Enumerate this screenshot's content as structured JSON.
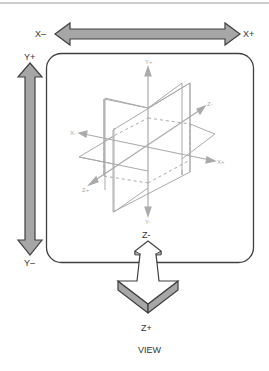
{
  "diagram": {
    "title": "VIEW",
    "labels": {
      "x_minus": "X–",
      "x_plus": "X+",
      "y_plus": "Y+",
      "y_minus": "Y–",
      "z_minus": "Z-",
      "z_plus": "Z+"
    },
    "inner_axes": {
      "y_plus": "Y+",
      "y_minus": "Y-",
      "x_minus": "X-",
      "x_plus": "X+",
      "z_minus": "Z-",
      "z_plus": "Z+"
    },
    "colors": {
      "arrow_fill": "#a6a6a6",
      "arrow_stroke": "#404040",
      "box_stroke": "#404040",
      "axes_stroke": "#aaaaaa",
      "top_rule": "#999999"
    }
  }
}
